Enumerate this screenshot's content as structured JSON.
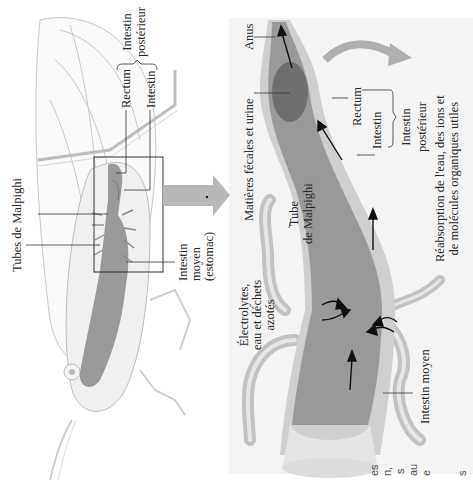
{
  "orientation": "rotated 90deg counter-clockwise",
  "overview": {
    "labels": {
      "rectum": "Rectum",
      "intestin": "Intestin",
      "intestin_posterieur": [
        "Intestin",
        "postérieur"
      ],
      "tubes_malpighi": "Tubes de Malpighi",
      "intestin_moyen": [
        "Intestin",
        "moyen",
        "(estomac)"
      ]
    }
  },
  "detail": {
    "labels": {
      "anus": "Anus",
      "matieres": "Matières fécales et urine",
      "rectum": "Rectum",
      "intestin": "Intestin",
      "intestin_posterieur": [
        "Intestin",
        "postérieur"
      ],
      "reabsorption": [
        "Réabsorption de l'eau, des ions et",
        "de molécules organiques utiles"
      ],
      "tube_malpighi": [
        "Tube",
        "de Malpighi"
      ],
      "electrolytes": [
        "Électrolytes,",
        "eau et déchets",
        "azotés"
      ],
      "intestin_moyen": "Intestin moyen"
    }
  },
  "cropped_text_fragments": [
    "es",
    "n,",
    "s",
    "au",
    "e",
    "s"
  ],
  "colors": {
    "panel_bg": "#f4f4f4",
    "gut_fill": "#8f8f8f",
    "gut_wall": "#c9c9c9",
    "arrow_gray": "#b5b5b5",
    "label_line": "#333333"
  }
}
